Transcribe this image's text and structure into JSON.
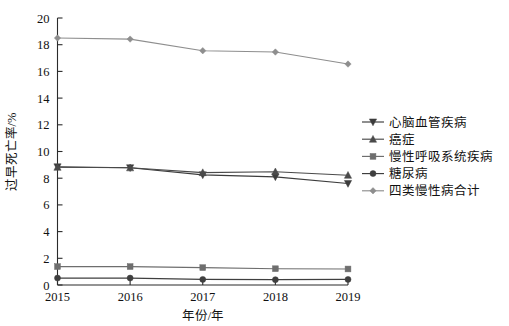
{
  "chart_data": {
    "type": "line",
    "title": "",
    "subtitle": "",
    "xlabel": "年份/年",
    "ylabel": "过早死亡率/%",
    "categories": [
      "2015",
      "2016",
      "2017",
      "2018",
      "2019"
    ],
    "x": [
      2015,
      2016,
      2017,
      2018,
      2019
    ],
    "xlim": [
      2015,
      2019
    ],
    "ylim": [
      0,
      20
    ],
    "yticks": [
      0,
      2,
      4,
      6,
      8,
      10,
      12,
      14,
      16,
      18,
      20
    ],
    "ytick_labels": [
      "0",
      "2",
      "4",
      "6",
      "8",
      "10",
      "12",
      "14",
      "16",
      "18",
      "20"
    ],
    "xticks": [
      2015,
      2016,
      2017,
      2018,
      2019
    ],
    "xtick_labels": [
      "2015",
      "2016",
      "2017",
      "2018",
      "2019"
    ],
    "grid": false,
    "legend_position": "right",
    "series": [
      {
        "name": "心脑血管疾病",
        "marker": "triangle-down",
        "color": "#3c3c3c",
        "values": [
          8.85,
          8.78,
          8.25,
          8.1,
          7.6
        ]
      },
      {
        "name": "癌症",
        "marker": "triangle-up",
        "color": "#4a4a4a",
        "values": [
          8.82,
          8.78,
          8.42,
          8.48,
          8.22
        ]
      },
      {
        "name": "慢性呼吸系统疾病",
        "marker": "square",
        "color": "#6e6e6e",
        "values": [
          1.38,
          1.38,
          1.3,
          1.22,
          1.2
        ]
      },
      {
        "name": "糖尿病",
        "marker": "circle",
        "color": "#3f3f3f",
        "values": [
          0.52,
          0.52,
          0.42,
          0.4,
          0.42
        ]
      },
      {
        "name": "四类慢性病合计",
        "marker": "diamond",
        "color": "#8e8e8e",
        "values": [
          18.5,
          18.42,
          17.55,
          17.45,
          16.55
        ]
      }
    ]
  },
  "legend": {
    "entries": [
      {
        "label": "心脑血管疾病"
      },
      {
        "label": "癌症"
      },
      {
        "label": "慢性呼吸系统疾病"
      },
      {
        "label": "糖尿病"
      },
      {
        "label": "四类慢性病合计"
      }
    ]
  },
  "axes": {
    "y_title": "过早死亡率/%",
    "x_title": "年份/年"
  },
  "colors": {
    "axis": "#2b2b2b",
    "text": "#111111",
    "background": "#ffffff"
  }
}
